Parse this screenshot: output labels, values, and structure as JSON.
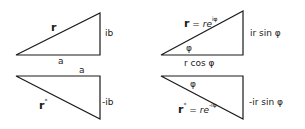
{
  "diagram": {
    "colors": {
      "stroke": "#1a1a1a",
      "background": "#ffffff"
    },
    "cartesian_top": {
      "hypotenuse": "r",
      "vertical": "ib",
      "horizontal": "a"
    },
    "cartesian_bottom": {
      "hypotenuse": "r",
      "hypotenuse_sup": "*",
      "vertical": "-ib",
      "horizontal": "a"
    },
    "polar_top": {
      "hypotenuse_r": "r",
      "hypotenuse_eq": " = ",
      "hypotenuse_expr": "re",
      "hypotenuse_sup": "iφ",
      "vertical": "ir sin φ",
      "angle": "φ",
      "horizontal": "r cos φ"
    },
    "polar_bottom": {
      "hypotenuse_r": "r",
      "hypotenuse_star": "*",
      "hypotenuse_eq": " = ",
      "hypotenuse_expr": "re",
      "hypotenuse_sup": "-iφ",
      "vertical": "-ir sin φ",
      "angle": "φ"
    }
  }
}
